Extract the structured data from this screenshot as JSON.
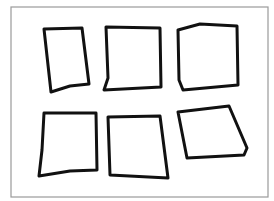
{
  "canvas": {
    "width": 274,
    "height": 201,
    "background": "#ffffff"
  },
  "frame": {
    "x": 11,
    "y": 7,
    "width": 257,
    "height": 190,
    "stroke": "#9a9a9a"
  },
  "stroke_color": "#111111",
  "shapes": [
    {
      "id": "shape-1",
      "points": "44,29 82,28 89,84 70,86 51,92"
    },
    {
      "id": "shape-2",
      "points": "106,27 160,28 161,87 104,90 108,78"
    },
    {
      "id": "shape-3",
      "points": "178,30 200,24 237,26 238,85 183,90 179,80"
    },
    {
      "id": "shape-4",
      "points": "44,113 96,113 97,170 70,171 39,176 42,150"
    },
    {
      "id": "shape-5",
      "points": "108,117 160,116 168,178 110,175"
    },
    {
      "id": "shape-6",
      "points": "178,112 229,106 247,148 244,155 187,158"
    }
  ]
}
